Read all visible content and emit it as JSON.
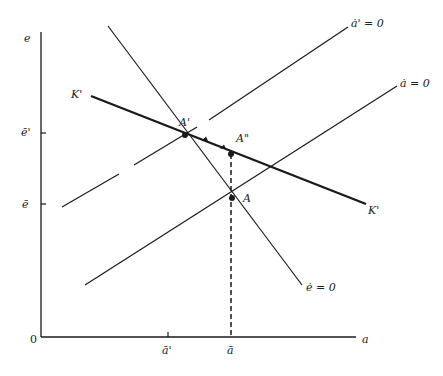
{
  "diagram": {
    "axes": {
      "x_label": "a",
      "y_label": "e",
      "origin_label": "0",
      "x_ticks": [
        {
          "label": "ā'",
          "x": 168
        },
        {
          "label": "ā",
          "x": 231
        }
      ],
      "y_ticks": [
        {
          "label": "ē'",
          "y": 133
        },
        {
          "label": "ē",
          "y": 204
        }
      ]
    },
    "curves": {
      "e_dot_zero": {
        "label": "ė = 0",
        "style": "solid"
      },
      "a_dot_zero": {
        "label": "ȧ = 0",
        "style": "solid"
      },
      "a_dot_prime_zero": {
        "label": "ȧ' = 0",
        "style": "dashed"
      },
      "saddle_path": {
        "label_left": "K'",
        "label_right": "K'",
        "style": "thick"
      }
    },
    "points": {
      "A": {
        "label": "A"
      },
      "A_prime": {
        "label": "A'"
      },
      "A_double_prime": {
        "label": "A\""
      }
    },
    "colors": {
      "ink": "#1a1a1a",
      "background": "#ffffff"
    }
  }
}
